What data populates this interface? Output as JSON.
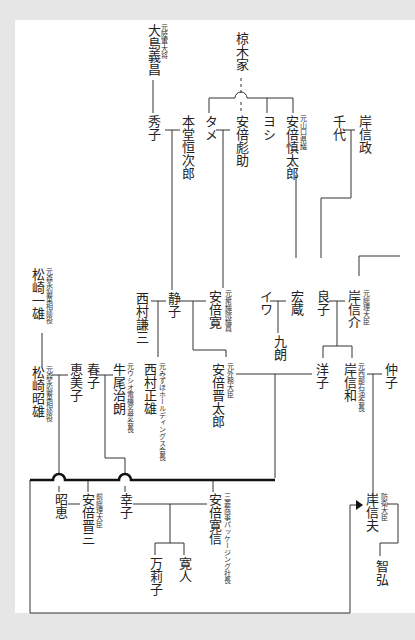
{
  "diagram": {
    "colors": {
      "background": "#e6e6e6",
      "page": "#ffffff",
      "line": "#333333",
      "text": "#222222"
    },
    "people": [
      {
        "id": "oshima_yoshimasa",
        "name": "大島義昌",
        "caption": "元陸軍大将"
      },
      {
        "id": "mukunoki",
        "name": "椋木家",
        "caption": ""
      },
      {
        "id": "hideko",
        "name": "秀子",
        "caption": ""
      },
      {
        "id": "hondo_tsunejiro",
        "name": "本堂恒次郎",
        "caption": ""
      },
      {
        "id": "tame",
        "name": "タメ",
        "caption": ""
      },
      {
        "id": "abe_hikosuke",
        "name": "安倍彪助",
        "caption": ""
      },
      {
        "id": "yoshi",
        "name": "ヨシ",
        "caption": ""
      },
      {
        "id": "abe_shintaro_elder",
        "name": "安倍慎太郎",
        "caption": "元山口県議"
      },
      {
        "id": "chiyo",
        "name": "千代",
        "caption": ""
      },
      {
        "id": "kishi_nobumasa",
        "name": "岸信政",
        "caption": ""
      },
      {
        "id": "matsuzaki_ichio",
        "name": "松崎一雄",
        "caption": "元森永製菓相談役"
      },
      {
        "id": "nishimura_kenzo",
        "name": "西村謙三",
        "caption": ""
      },
      {
        "id": "shizuko",
        "name": "静子",
        "caption": ""
      },
      {
        "id": "abe_kan",
        "name": "安倍寛",
        "caption": "元衆議院議員"
      },
      {
        "id": "iwa",
        "name": "イワ",
        "caption": ""
      },
      {
        "id": "hiroku",
        "name": "宏蔵",
        "caption": ""
      },
      {
        "id": "kuro",
        "name": "九朗",
        "caption": ""
      },
      {
        "id": "yoshiko",
        "name": "良子",
        "caption": ""
      },
      {
        "id": "kishi_nobusuke",
        "name": "岸信介",
        "caption": "元総理大臣"
      },
      {
        "id": "matsuzaki_akio",
        "name": "松崎昭雄",
        "caption": "元森永製菓相談役"
      },
      {
        "id": "emiko",
        "name": "恵美子",
        "caption": ""
      },
      {
        "id": "haruko",
        "name": "春子",
        "caption": ""
      },
      {
        "id": "ushio_jiro",
        "name": "牛尾治朗",
        "caption": "元ウシオ電機名誉会長"
      },
      {
        "id": "nishimura_masao",
        "name": "西村正雄",
        "caption": "元みずほホールディングス会長"
      },
      {
        "id": "abe_shintaro",
        "name": "安倍晋太郎",
        "caption": "元外務大臣"
      },
      {
        "id": "yoko",
        "name": "洋子",
        "caption": ""
      },
      {
        "id": "kishi_nobukazu",
        "name": "岸信和",
        "caption": "元西部石油会長"
      },
      {
        "id": "nakako",
        "name": "仲子",
        "caption": ""
      },
      {
        "id": "akie",
        "name": "昭恵",
        "caption": ""
      },
      {
        "id": "abe_shinzo",
        "name": "安倍晋三",
        "caption": "前総理大臣"
      },
      {
        "id": "sachiko",
        "name": "幸子",
        "caption": ""
      },
      {
        "id": "abe_hironobu",
        "name": "安倍寛信",
        "caption": "三菱商事パッケージング社長"
      },
      {
        "id": "mariko",
        "name": "万莉子",
        "caption": ""
      },
      {
        "id": "hiroto",
        "name": "寛人",
        "caption": ""
      },
      {
        "id": "kishi_nobuo",
        "name": "岸信夫",
        "caption": "防衛大臣"
      },
      {
        "id": "tomohiro",
        "name": "智弘",
        "caption": ""
      }
    ]
  }
}
